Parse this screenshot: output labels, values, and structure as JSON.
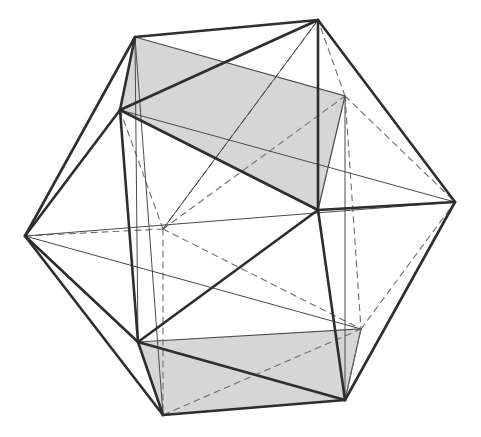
{
  "diagram": {
    "colors": {
      "background": "#ffffff",
      "edge_front": "#2e2e2e",
      "edge_thin": "#4a4a4a",
      "edge_hidden": "#6e6e6e",
      "rect_fill": "#d6d6d6"
    },
    "vertices": {
      "T1": [
        135,
        37
      ],
      "T2": [
        318,
        20
      ],
      "UL": [
        120,
        110
      ],
      "HR": [
        345,
        96
      ],
      "L": [
        25,
        236
      ],
      "HC": [
        163,
        229
      ],
      "C": [
        318,
        210
      ],
      "R": [
        455,
        202
      ],
      "LL": [
        138,
        342
      ],
      "HLR": [
        361,
        329
      ],
      "BL": [
        163,
        415
      ],
      "BR": [
        345,
        400
      ]
    },
    "shaded_rectangles": [
      [
        "T1",
        "HR",
        "C",
        "UL"
      ],
      [
        "LL",
        "HLR",
        "BR",
        "BL"
      ]
    ],
    "front_edges": [
      [
        "T1",
        "T2"
      ],
      [
        "T1",
        "UL"
      ],
      [
        "T2",
        "UL"
      ],
      [
        "T2",
        "C"
      ],
      [
        "T2",
        "R"
      ],
      [
        "UL",
        "C"
      ],
      [
        "UL",
        "L"
      ],
      [
        "UL",
        "LL"
      ],
      [
        "L",
        "T1"
      ],
      [
        "L",
        "LL"
      ],
      [
        "L",
        "BL"
      ],
      [
        "C",
        "R"
      ],
      [
        "C",
        "LL"
      ],
      [
        "C",
        "BR"
      ],
      [
        "R",
        "BR"
      ],
      [
        "LL",
        "BL"
      ],
      [
        "LL",
        "BR"
      ],
      [
        "BL",
        "BR"
      ]
    ],
    "thin_edges": [
      [
        "T1",
        "HR"
      ],
      [
        "UL",
        "C2"
      ],
      [
        "L",
        "C2"
      ],
      [
        "T2",
        "HC"
      ],
      [
        "HR",
        "BR"
      ],
      [
        "T1",
        "BL"
      ],
      [
        "R",
        "BL"
      ],
      [
        "L",
        "HR2"
      ]
    ],
    "hidden_edges": [
      [
        "HC",
        "L"
      ],
      [
        "HC",
        "T2"
      ],
      [
        "HC",
        "HR"
      ],
      [
        "HC",
        "BL"
      ],
      [
        "HC",
        "HLR"
      ],
      [
        "HC",
        "UL"
      ],
      [
        "HR",
        "R"
      ],
      [
        "HR",
        "T2"
      ],
      [
        "HR",
        "HLR"
      ],
      [
        "HLR",
        "R"
      ],
      [
        "HLR",
        "BL"
      ],
      [
        "HLR",
        "BR"
      ]
    ]
  }
}
